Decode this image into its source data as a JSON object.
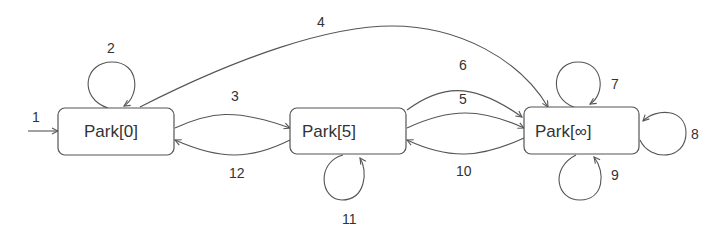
{
  "diagram": {
    "type": "state-machine",
    "nodes": [
      {
        "id": "park0",
        "label": "Park[0]"
      },
      {
        "id": "park5",
        "label": "Park[5]"
      },
      {
        "id": "parkinf",
        "label": "Park[∞]"
      }
    ],
    "edges": [
      {
        "id": "e1",
        "label": "1",
        "from": null,
        "to": "park0",
        "kind": "initial"
      },
      {
        "id": "e2",
        "label": "2",
        "from": "park0",
        "to": "park0",
        "kind": "self-loop-top"
      },
      {
        "id": "e3",
        "label": "3",
        "from": "park0",
        "to": "park5"
      },
      {
        "id": "e4",
        "label": "4",
        "from": "park0",
        "to": "parkinf"
      },
      {
        "id": "e5",
        "label": "5",
        "from": "park5",
        "to": "parkinf"
      },
      {
        "id": "e6",
        "label": "6",
        "from": "park5",
        "to": "parkinf"
      },
      {
        "id": "e7",
        "label": "7",
        "from": "parkinf",
        "to": "parkinf",
        "kind": "self-loop-top"
      },
      {
        "id": "e8",
        "label": "8",
        "from": "parkinf",
        "to": "parkinf",
        "kind": "self-loop-right"
      },
      {
        "id": "e9",
        "label": "9",
        "from": "parkinf",
        "to": "parkinf",
        "kind": "self-loop-bottom"
      },
      {
        "id": "e10",
        "label": "10",
        "from": "parkinf",
        "to": "park5"
      },
      {
        "id": "e11",
        "label": "11",
        "from": "park5",
        "to": "park5",
        "kind": "self-loop-bottom"
      },
      {
        "id": "e12",
        "label": "12",
        "from": "park5",
        "to": "park0"
      }
    ]
  }
}
